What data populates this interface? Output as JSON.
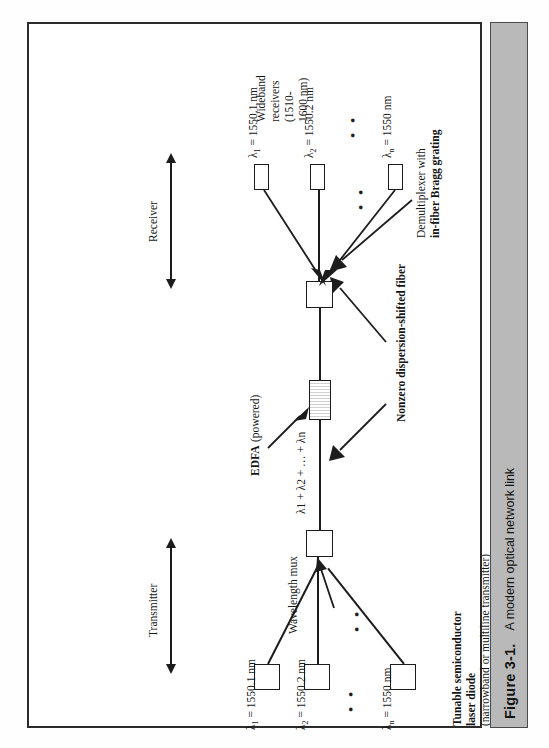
{
  "caption": {
    "number": "Figure 3-1.",
    "text": "A modern optical network link"
  },
  "figure": {
    "spans": [
      {
        "label": "Transmitter"
      },
      {
        "label": "Receiver"
      }
    ],
    "transmitter": {
      "sources": [
        {
          "label": "λ",
          "sub": "1",
          "value": "= 1550.1 nm"
        },
        {
          "label": "λ",
          "sub": "2",
          "value": "= 1550.2 nm"
        },
        {
          "label": "λ",
          "sub": "n",
          "value": "= 1550 nm"
        }
      ],
      "device_caption_bold_1": "Tunable semiconductor",
      "device_caption_bold_2": "laser diode",
      "device_caption_plain": "(narrowband or multiline transmitter)",
      "mux_label": "Wavelength mux",
      "ellipsis": "• •"
    },
    "trunk": {
      "sum_label": "λ1 + λ2 + … + λn",
      "amplifier_bold": "EDFA",
      "amplifier_plain": "(powered)",
      "fiber_label": "Nonzero dispersion-shifted fiber"
    },
    "receiver": {
      "demux_plain": "Demultiplexer with",
      "demux_bold": "in-fiber Bragg grating",
      "detectors": [
        {
          "label": "λ",
          "sub": "1",
          "value": "= 1550.1 nm"
        },
        {
          "label": "λ",
          "sub": "2",
          "value": "= 1550.2 nm"
        },
        {
          "label": "λ",
          "sub": "n",
          "value": "= 1550 nm"
        }
      ],
      "receiver_note_1": "Wideband",
      "receiver_note_2": "receivers",
      "receiver_note_3": "(1510-",
      "receiver_note_4": "1600 nm)",
      "ellipsis": "• •"
    }
  },
  "colors": {
    "ink": "#1c1c1c",
    "caption_bar": "#b9b9b9",
    "page": "#ffffff"
  }
}
